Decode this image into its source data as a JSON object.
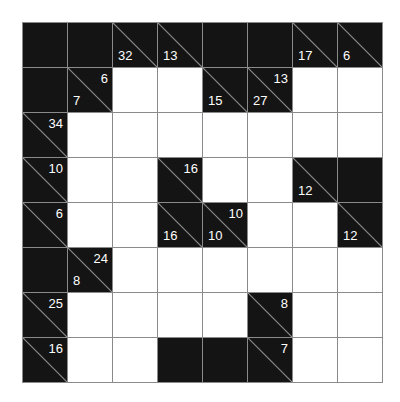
{
  "puzzle": {
    "type": "kakuro",
    "rows": 8,
    "cols": 8,
    "colors": {
      "block": "#141414",
      "white": "#ffffff",
      "grid_line": "#8a8a8a",
      "clue_text": "#ffffff"
    },
    "grid": [
      [
        {
          "t": "B"
        },
        {
          "t": "B"
        },
        {
          "t": "C",
          "down": "32"
        },
        {
          "t": "C",
          "down": "13"
        },
        {
          "t": "B"
        },
        {
          "t": "B"
        },
        {
          "t": "C",
          "down": "17"
        },
        {
          "t": "C",
          "down": "6"
        }
      ],
      [
        {
          "t": "B"
        },
        {
          "t": "C",
          "across": "6",
          "down": "7"
        },
        {
          "t": "W"
        },
        {
          "t": "W"
        },
        {
          "t": "C",
          "down": "15"
        },
        {
          "t": "C",
          "across": "13",
          "down": "27"
        },
        {
          "t": "W"
        },
        {
          "t": "W"
        }
      ],
      [
        {
          "t": "C",
          "across": "34"
        },
        {
          "t": "W"
        },
        {
          "t": "W"
        },
        {
          "t": "W"
        },
        {
          "t": "W"
        },
        {
          "t": "W"
        },
        {
          "t": "W"
        },
        {
          "t": "W"
        }
      ],
      [
        {
          "t": "C",
          "across": "10"
        },
        {
          "t": "W"
        },
        {
          "t": "W"
        },
        {
          "t": "C",
          "across": "16"
        },
        {
          "t": "W"
        },
        {
          "t": "W"
        },
        {
          "t": "C",
          "down": "12"
        },
        {
          "t": "B"
        }
      ],
      [
        {
          "t": "C",
          "across": "6"
        },
        {
          "t": "W"
        },
        {
          "t": "W"
        },
        {
          "t": "C",
          "down": "16"
        },
        {
          "t": "C",
          "across": "10",
          "down": "10"
        },
        {
          "t": "W"
        },
        {
          "t": "W"
        },
        {
          "t": "C",
          "down": "12"
        }
      ],
      [
        {
          "t": "B"
        },
        {
          "t": "C",
          "across": "24",
          "down": "8"
        },
        {
          "t": "W"
        },
        {
          "t": "W"
        },
        {
          "t": "W"
        },
        {
          "t": "W"
        },
        {
          "t": "W"
        },
        {
          "t": "W"
        }
      ],
      [
        {
          "t": "C",
          "across": "25"
        },
        {
          "t": "W"
        },
        {
          "t": "W"
        },
        {
          "t": "W"
        },
        {
          "t": "W"
        },
        {
          "t": "C",
          "across": "8"
        },
        {
          "t": "W"
        },
        {
          "t": "W"
        }
      ],
      [
        {
          "t": "C",
          "across": "16"
        },
        {
          "t": "W"
        },
        {
          "t": "W"
        },
        {
          "t": "B"
        },
        {
          "t": "B"
        },
        {
          "t": "C",
          "across": "7"
        },
        {
          "t": "W"
        },
        {
          "t": "W"
        }
      ]
    ]
  }
}
